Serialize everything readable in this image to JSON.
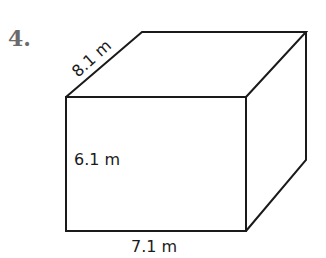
{
  "problem": {
    "number": "4."
  },
  "figure": {
    "type": "rectangular-prism",
    "colors": {
      "stroke": "#1a1a1a",
      "number": "#6b6b6b"
    },
    "dimensions": {
      "depth": {
        "value": 8.1,
        "unit": "m",
        "label": "8.1 m"
      },
      "height": {
        "value": 6.1,
        "unit": "m",
        "label": "6.1 m"
      },
      "width": {
        "value": 7.1,
        "unit": "m",
        "label": "7.1 m"
      }
    }
  }
}
